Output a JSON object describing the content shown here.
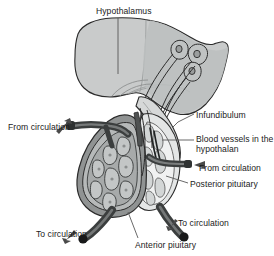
{
  "figure": {
    "background_color": "#ffffff"
  },
  "labels": {
    "hypothalamus": "Hypothalamus",
    "infundibulum": "Infundibulum",
    "blood_vessels": "Blood vessels in the hypothalan",
    "from_circulation_right": "From circulation",
    "posterior_pituitary": "Posterior pituitary",
    "from_circulation_left": "From circulation",
    "to_circulation_left": "To circulation",
    "to_circulation_right": "To circulation",
    "anterior_pituitary": "Anterior piuitary"
  },
  "colors": {
    "outline": "#2b2b2b",
    "hypothalamus_fill": "#c9cbcb",
    "anterior_fill": "#8f9292",
    "anterior_inner": "#b9bcbc",
    "posterior_fill": "#e3e5e5",
    "posterior_mid": "#c6c9c9",
    "vessel_dark": "#3b3e3e",
    "vessel_mid": "#6f7272",
    "leader_line": "#585858",
    "text": "#1b1b1b",
    "arrow": "#4a4a4a"
  },
  "icons": {
    "arrow_from_circulation_left": "arrow-up-right-icon",
    "arrow_from_circulation_right": "arrow-left-icon",
    "arrow_to_circulation_left": "arrow-down-left-icon",
    "arrow_to_circulation_right": "arrow-down-left-icon"
  },
  "structures": [
    "hypothalamus",
    "neurosecretory-cell-bodies",
    "axon-tract",
    "infundibulum",
    "anterior-pituitary",
    "posterior-pituitary",
    "hypophyseal-portal-vessels",
    "efferent-veins"
  ]
}
